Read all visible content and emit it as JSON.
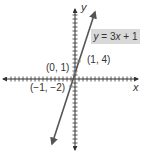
{
  "chart_data": {
    "type": "line",
    "title": "",
    "equation": "y = 3x + 1",
    "xlabel": "x",
    "ylabel": "y",
    "series": [
      {
        "name": "y = 3x + 1",
        "x": [
          -1,
          0,
          1
        ],
        "y": [
          -2,
          1,
          4
        ],
        "color": "#555555"
      }
    ],
    "points": [
      {
        "label": "(0, 1)",
        "x": 0,
        "y": 1
      },
      {
        "label": "(1, 4)",
        "x": 1,
        "y": 4
      },
      {
        "label": "(-1, -2)",
        "x": -1,
        "y": -2
      }
    ],
    "xlim": [
      -14,
      14
    ],
    "ylim": [
      -16,
      16
    ],
    "grid": false,
    "axes_arrows": true,
    "line_arrows": true
  },
  "labels": {
    "y_axis": "y",
    "x_axis": "x",
    "eq_y": "y",
    "eq_rest": " = 3",
    "eq_x": "x",
    "eq_tail": " + 1",
    "pt_0_1": "(0, 1)",
    "pt_1_4": "(1, 4)",
    "pt_m1_m2": "(−1, −2)"
  },
  "colors": {
    "axis": "#333333",
    "line": "#555555",
    "label_box": "#d9d9d9",
    "point": "#777777"
  }
}
